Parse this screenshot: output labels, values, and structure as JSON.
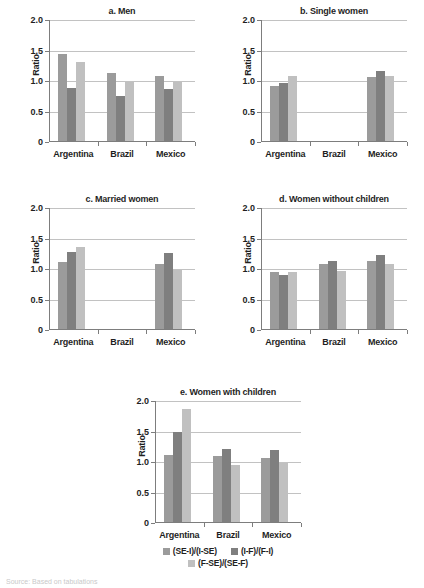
{
  "figure": {
    "y_axis_label": "Ratio",
    "y_ticks": [
      "2.0",
      "1.5",
      "1.0",
      "0.5",
      "0"
    ],
    "y_tick_values": [
      2.0,
      1.5,
      1.0,
      0.5,
      0
    ],
    "categories": [
      "Argentina",
      "Brazil",
      "Mexico"
    ],
    "source_note": "Source: Based on tabulations"
  },
  "legend": {
    "items": [
      {
        "label": "(SE-I)/(I-SE)",
        "color": "#9b9b9b"
      },
      {
        "label": "(I-F)/(F-I)",
        "color": "#7f7f7f"
      },
      {
        "label": "(F-SE)/(SE-F)",
        "color": "#c0c0c0"
      }
    ]
  },
  "panels": {
    "a": {
      "title": "a. Men"
    },
    "b": {
      "title": "b. Single women"
    },
    "c": {
      "title": "c. Married women"
    },
    "d": {
      "title": "d. Women without children"
    },
    "e": {
      "title": "e. Women with children"
    }
  },
  "chart_data": [
    {
      "type": "bar",
      "title": "a. Men",
      "xlabel": "",
      "ylabel": "Ratio",
      "ylim": [
        0,
        2.0
      ],
      "yticks": [
        0,
        0.5,
        1.0,
        1.5,
        2.0
      ],
      "grid": true,
      "legend_position": "bottom-shared",
      "categories": [
        "Argentina",
        "Brazil",
        "Mexico"
      ],
      "series": [
        {
          "name": "(SE-I)/(I-SE)",
          "color": "#9b9b9b",
          "values": [
            1.42,
            1.11,
            1.06
          ]
        },
        {
          "name": "(I-F)/(F-I)",
          "color": "#7f7f7f",
          "values": [
            0.87,
            0.73,
            0.86
          ]
        },
        {
          "name": "(F-SE)/(SE-F)",
          "color": "#c0c0c0",
          "values": [
            1.29,
            0.97,
            0.97
          ]
        }
      ]
    },
    {
      "type": "bar",
      "title": "b. Single women",
      "xlabel": "",
      "ylabel": "Ratio",
      "ylim": [
        0,
        2.0
      ],
      "yticks": [
        0,
        0.5,
        1.0,
        1.5,
        2.0
      ],
      "grid": true,
      "legend_position": "bottom-shared",
      "categories": [
        "Argentina",
        "Brazil",
        "Mexico"
      ],
      "series": [
        {
          "name": "(SE-I)/(I-SE)",
          "color": "#9b9b9b",
          "values": [
            0.91,
            null,
            1.05
          ]
        },
        {
          "name": "(I-F)/(F-I)",
          "color": "#7f7f7f",
          "values": [
            0.95,
            null,
            1.15
          ]
        },
        {
          "name": "(F-SE)/(SE-F)",
          "color": "#c0c0c0",
          "values": [
            1.06,
            null,
            1.06
          ]
        }
      ]
    },
    {
      "type": "bar",
      "title": "c. Married women",
      "xlabel": "",
      "ylabel": "Ratio",
      "ylim": [
        0,
        2.0
      ],
      "yticks": [
        0,
        0.5,
        1.0,
        1.5,
        2.0
      ],
      "grid": true,
      "legend_position": "bottom-shared",
      "categories": [
        "Argentina",
        "Brazil",
        "Mexico"
      ],
      "series": [
        {
          "name": "(SE-I)/(I-SE)",
          "color": "#9b9b9b",
          "values": [
            1.1,
            null,
            1.07
          ]
        },
        {
          "name": "(I-F)/(F-I)",
          "color": "#7f7f7f",
          "values": [
            1.27,
            null,
            1.24
          ]
        },
        {
          "name": "(F-SE)/(SE-F)",
          "color": "#c0c0c0",
          "values": [
            1.35,
            null,
            0.97
          ]
        }
      ]
    },
    {
      "type": "bar",
      "title": "d. Women without children",
      "xlabel": "",
      "ylabel": "Ratio",
      "ylim": [
        0,
        2.0
      ],
      "yticks": [
        0,
        0.5,
        1.0,
        1.5,
        2.0
      ],
      "grid": true,
      "legend_position": "bottom-shared",
      "categories": [
        "Argentina",
        "Brazil",
        "Mexico"
      ],
      "series": [
        {
          "name": "(SE-I)/(I-SE)",
          "color": "#9b9b9b",
          "values": [
            0.94,
            1.06,
            1.11
          ]
        },
        {
          "name": "(I-F)/(F-I)",
          "color": "#7f7f7f",
          "values": [
            0.88,
            1.12,
            1.21
          ]
        },
        {
          "name": "(F-SE)/(SE-F)",
          "color": "#c0c0c0",
          "values": [
            0.94,
            0.95,
            1.07
          ]
        }
      ]
    },
    {
      "type": "bar",
      "title": "e. Women with children",
      "xlabel": "",
      "ylabel": "Ratio",
      "ylim": [
        0,
        2.0
      ],
      "yticks": [
        0,
        0.5,
        1.0,
        1.5,
        2.0
      ],
      "grid": true,
      "legend_position": "bottom",
      "categories": [
        "Argentina",
        "Brazil",
        "Mexico"
      ],
      "series": [
        {
          "name": "(SE-I)/(I-SE)",
          "color": "#9b9b9b",
          "values": [
            1.1,
            1.09,
            1.05
          ]
        },
        {
          "name": "(I-F)/(F-I)",
          "color": "#7f7f7f",
          "values": [
            1.47,
            1.2,
            1.18
          ]
        },
        {
          "name": "(F-SE)/(SE-F)",
          "color": "#c0c0c0",
          "values": [
            1.85,
            0.94,
            0.97
          ]
        }
      ]
    }
  ]
}
